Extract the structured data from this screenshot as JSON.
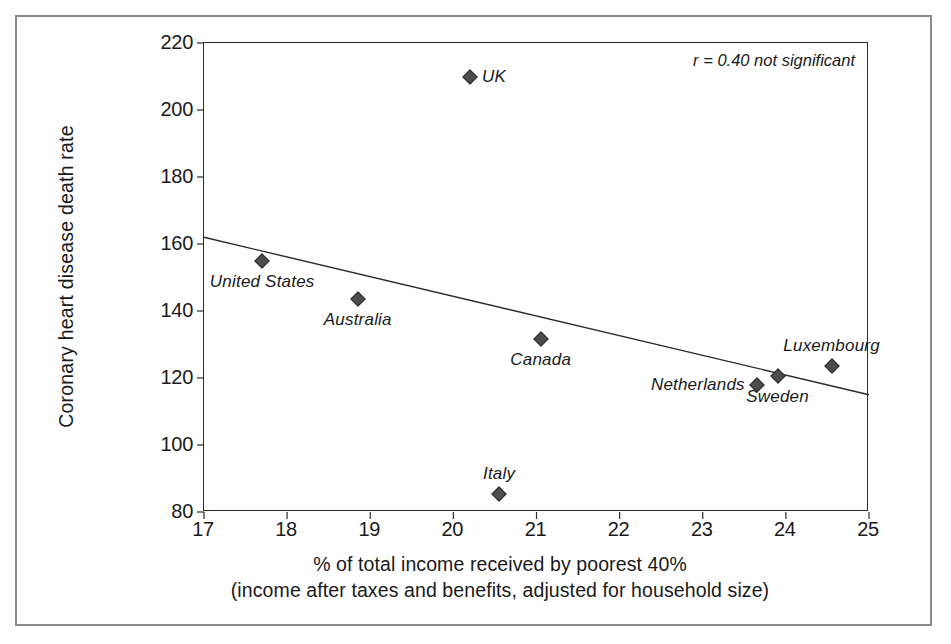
{
  "chart_data": {
    "type": "scatter",
    "title": "",
    "xlabel": "% of total income received by poorest 40%",
    "xlabel_line2": "(income after taxes and benefits, adjusted for household size)",
    "ylabel": "Coronary heart disease death rate",
    "xlim": [
      17,
      25
    ],
    "ylim": [
      80,
      220
    ],
    "xticks": [
      17,
      18,
      19,
      20,
      21,
      22,
      23,
      24,
      25
    ],
    "yticks": [
      80,
      100,
      120,
      140,
      160,
      180,
      200,
      220
    ],
    "grid": false,
    "legend": "none",
    "annotation": "r = 0.40 not significant",
    "correlation_r": 0.4,
    "significance": "not significant",
    "trendline": {
      "type": "linear",
      "x_start": 17,
      "y_start": 162,
      "x_end": 25,
      "y_end": 115
    },
    "points": [
      {
        "label": "UK",
        "x": 20.2,
        "y": 210.0,
        "label_pos": "right"
      },
      {
        "label": "United States",
        "x": 17.7,
        "y": 155.0,
        "label_pos": "below"
      },
      {
        "label": "Australia",
        "x": 18.85,
        "y": 143.5,
        "label_pos": "below"
      },
      {
        "label": "Canada",
        "x": 21.05,
        "y": 131.5,
        "label_pos": "below"
      },
      {
        "label": "Luxembourg",
        "x": 24.55,
        "y": 123.5,
        "label_pos": "above"
      },
      {
        "label": "Sweden",
        "x": 23.9,
        "y": 120.5,
        "label_pos": "below"
      },
      {
        "label": "Netherlands",
        "x": 23.65,
        "y": 118.0,
        "label_pos": "left"
      },
      {
        "label": "Italy",
        "x": 20.55,
        "y": 85.5,
        "label_pos": "above"
      }
    ],
    "colors": {
      "marker": "#4d4d4d",
      "axis": "#2b2b2b",
      "trendline": "#2b2b2b",
      "frame": "#8a8a8a",
      "text": "#1a1a1a",
      "background": "#ffffff"
    }
  }
}
